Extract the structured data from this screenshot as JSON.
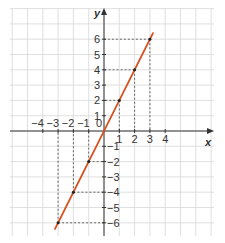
{
  "chart_data": {
    "type": "line",
    "title": "",
    "xlabel": "x",
    "ylabel": "y",
    "xlim": [
      -4,
      4
    ],
    "ylim": [
      -6,
      6
    ],
    "grid": true,
    "x_ticks": [
      -4,
      -3,
      -2,
      -1,
      1,
      2,
      3,
      4
    ],
    "y_ticks": [
      -6,
      -5,
      -4,
      -3,
      -2,
      -1,
      1,
      2,
      3,
      4,
      5,
      6
    ],
    "x_tick_labels": [
      "−4",
      "−3",
      "−2",
      "−1",
      "1",
      "2",
      "3",
      "4"
    ],
    "y_tick_labels": [
      "−6",
      "−5",
      "−4",
      "−3",
      "−2",
      "−1",
      "1",
      "2",
      "3",
      "4",
      "5",
      "6"
    ],
    "origin_label": "0",
    "series": [
      {
        "name": "y = 2x",
        "color": "#d4501e",
        "x": [
          -3.2,
          3.2
        ],
        "y": [
          -6.4,
          6.4
        ]
      }
    ],
    "marked_points": [
      {
        "x": -3,
        "y": -6
      },
      {
        "x": -2,
        "y": -4
      },
      {
        "x": -1,
        "y": -2
      },
      {
        "x": 1,
        "y": 2
      },
      {
        "x": 2,
        "y": 4
      },
      {
        "x": 3,
        "y": 6
      }
    ]
  },
  "layout": {
    "origin_px": [
      104,
      131
    ],
    "unit_px": 15.3,
    "grid_px": {
      "left": 10,
      "right": 214,
      "top": 8,
      "bottom": 236
    },
    "colors": {
      "grid": "#d8d8d8",
      "axis": "#333333",
      "line": "#d4501e",
      "guide": "#444444",
      "point": "#222222"
    }
  }
}
